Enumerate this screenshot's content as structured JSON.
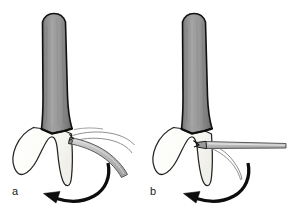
{
  "figure": {
    "background_color": "#ffffff",
    "width": 290,
    "height": 223,
    "panels": [
      {
        "id": "a",
        "label": "a",
        "label_x": 12,
        "label_y": 186,
        "description": "Curved elevator blade engaged at the mesial aspect of the root, shaft angled downward to the right; superimposed thin outline shows the alternate blade position; a curved arrow beneath indicates the rotational direction of tooth movement to the left.",
        "parts": [
          {
            "name": "tooth-root",
            "fill": "#8a8a8a",
            "stroke": "#111111"
          },
          {
            "name": "alveolar-bone",
            "fill": "#fbfbf7",
            "stroke": "#222222"
          },
          {
            "name": "elevator-instrument",
            "fill": "#b9b9b9",
            "stroke": "#555555"
          },
          {
            "name": "elevator-ghost-outline",
            "fill": "none",
            "stroke": "#8d8d8d"
          },
          {
            "name": "rotation-arrow",
            "fill": "#0d0d0d",
            "stroke": "#0d0d0d"
          }
        ]
      },
      {
        "id": "b",
        "label": "b",
        "label_x": 150,
        "label_y": 186,
        "description": "Straight elevator blade seated horizontally into the periodontal space at the root surface; the thin outline beneath shows the previous curved position; a curved arrow beneath indicates the rotational direction of tooth movement to the left.",
        "parts": [
          {
            "name": "tooth-root",
            "fill": "#8a8a8a",
            "stroke": "#111111"
          },
          {
            "name": "alveolar-bone",
            "fill": "#fbfbf7",
            "stroke": "#222222"
          },
          {
            "name": "elevator-instrument",
            "fill": "#b9b9b9",
            "stroke": "#555555"
          },
          {
            "name": "elevator-ghost-outline",
            "fill": "none",
            "stroke": "#8d8d8d"
          },
          {
            "name": "rotation-arrow",
            "fill": "#0d0d0d",
            "stroke": "#0d0d0d"
          }
        ]
      }
    ],
    "colors": {
      "root_shading_light": "#a3a3a3",
      "root_shading_dark": "#6f6f6f",
      "root_outline": "#111111",
      "bone_fill": "#fbfbf7",
      "bone_outline": "#242424",
      "instrument_fill": "#bdbdbd",
      "instrument_outline": "#5a5a5a",
      "ghost_outline": "#8f8f8f",
      "arrow_color": "#0d0d0d",
      "label_color": "#1a1a1a",
      "background": "#ffffff"
    }
  }
}
